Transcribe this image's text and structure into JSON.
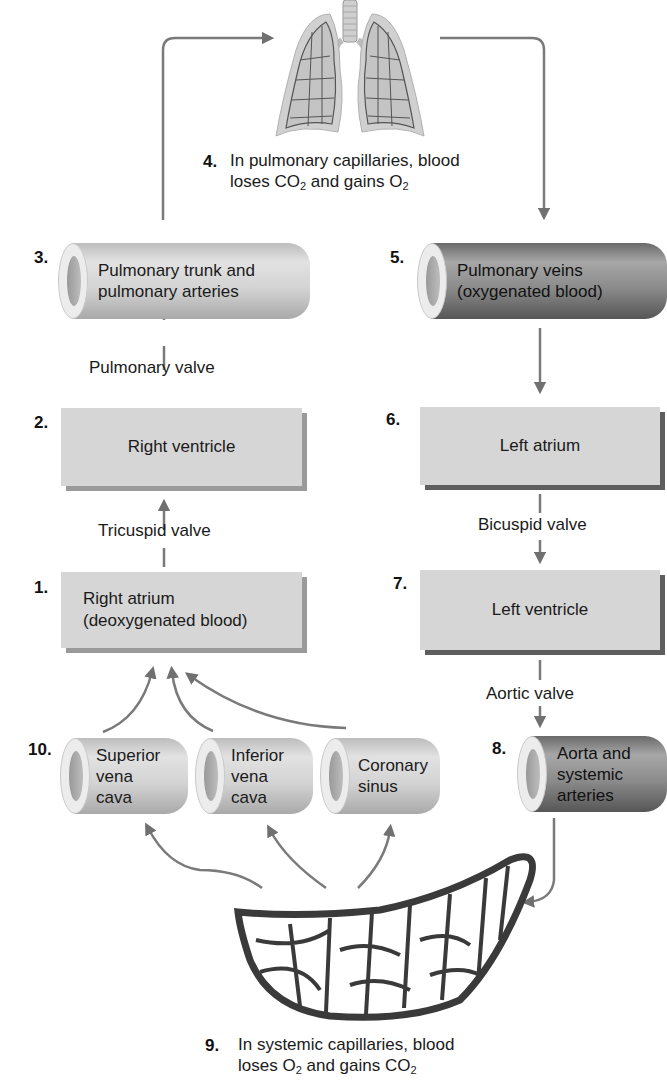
{
  "diagram": {
    "colors": {
      "arrow": "#707070",
      "box": "#d6d6d6",
      "box_shadow": "#9a9a9a",
      "dark_vessel": "#7a7a7a",
      "light_vessel": "#cfcfcf"
    },
    "steps": [
      {
        "num": "1.",
        "label_line1": "Right atrium",
        "label_line2": "(deoxygenated blood)",
        "shape": "box"
      },
      {
        "num": "2.",
        "label": "Right ventricle",
        "shape": "box"
      },
      {
        "num": "3.",
        "label_line1": "Pulmonary trunk and",
        "label_line2": "pulmonary arteries",
        "shape": "vessel-light"
      },
      {
        "num": "4.",
        "text_line1": "In pulmonary capillaries, blood",
        "text_line2_pre": "loses CO",
        "text_line2_sub1": "2",
        "text_line2_mid": " and gains O",
        "text_line2_sub2": "2",
        "shape": "lungs"
      },
      {
        "num": "5.",
        "label_line1": "Pulmonary veins",
        "label_line2": "(oxygenated blood)",
        "shape": "vessel-dark"
      },
      {
        "num": "6.",
        "label": "Left atrium",
        "shape": "box"
      },
      {
        "num": "7.",
        "label": "Left ventricle",
        "shape": "box"
      },
      {
        "num": "8.",
        "label_line1": "Aorta and",
        "label_line2": "systemic",
        "label_line3": "arteries",
        "shape": "vessel-dark"
      },
      {
        "num": "9.",
        "text_line1": "In systemic capillaries, blood",
        "text_line2_pre": "loses O",
        "text_line2_sub1": "2",
        "text_line2_mid": " and gains CO",
        "text_line2_sub2": "2",
        "shape": "capillary-bed"
      },
      {
        "num": "10.",
        "vessels": [
          {
            "line1": "Superior",
            "line2": "vena",
            "line3": "cava"
          },
          {
            "line1": "Inferior",
            "line2": "vena",
            "line3": "cava"
          },
          {
            "line1": "Coronary",
            "line2": "sinus"
          }
        ],
        "shape": "vessel-light"
      }
    ],
    "valves": {
      "pulmonary": "Pulmonary valve",
      "tricuspid": "Tricuspid valve",
      "bicuspid": "Bicuspid valve",
      "aortic": "Aortic valve"
    }
  }
}
